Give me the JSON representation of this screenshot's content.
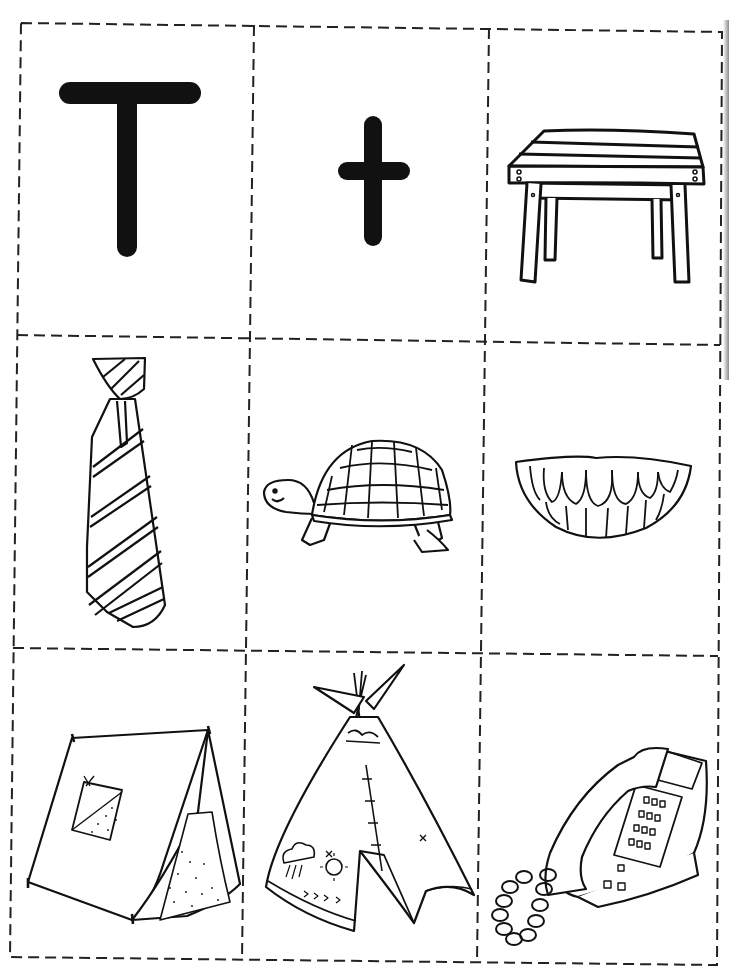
{
  "document": {
    "type": "letter picture cards",
    "letter": "T",
    "layout": {
      "rows": 3,
      "columns": 3,
      "border_style": "dashed cut lines"
    },
    "colors": {
      "ink": "#111111",
      "paper": "#ffffff",
      "cut_line": "#222222"
    }
  },
  "cards": [
    {
      "id": "uppercase-t",
      "label": "T",
      "kind": "letter"
    },
    {
      "id": "lowercase-t",
      "label": "t",
      "kind": "letter"
    },
    {
      "id": "table",
      "label": "table",
      "kind": "picture"
    },
    {
      "id": "tie",
      "label": "tie",
      "kind": "picture"
    },
    {
      "id": "turtle",
      "label": "turtle",
      "kind": "picture"
    },
    {
      "id": "teeth",
      "label": "teeth",
      "kind": "picture"
    },
    {
      "id": "tent",
      "label": "tent",
      "kind": "picture"
    },
    {
      "id": "teepee",
      "label": "teepee",
      "kind": "picture"
    },
    {
      "id": "telephone",
      "label": "telephone",
      "kind": "picture"
    }
  ]
}
